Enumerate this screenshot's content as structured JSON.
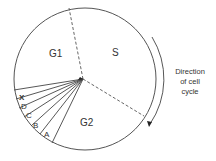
{
  "diagram": {
    "phases": [
      {
        "id": "G1",
        "label": "G1"
      },
      {
        "id": "S",
        "label": "S"
      },
      {
        "id": "G2",
        "label": "G2"
      }
    ],
    "sectors": [
      {
        "id": "X",
        "label": "X"
      },
      {
        "id": "D",
        "label": "D"
      },
      {
        "id": "C",
        "label": "C"
      },
      {
        "id": "B",
        "label": "B"
      },
      {
        "id": "A",
        "label": "A"
      }
    ],
    "direction_label": {
      "line1": "Direction",
      "line2": "of cell",
      "line3": "cycle"
    },
    "colors": {
      "stroke": "#444444",
      "text": "#333333",
      "background": "#ffffff"
    }
  }
}
